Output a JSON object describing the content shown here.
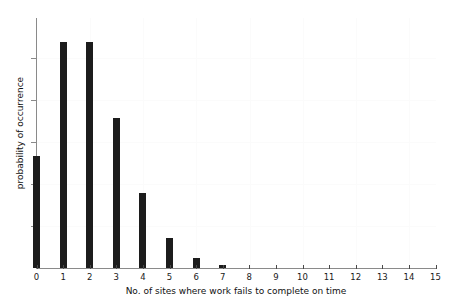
{
  "chart_data": {
    "type": "bar",
    "title": "",
    "subtitle": "",
    "xlabel": "No. of sites where work fails to complete on time",
    "ylabel": "probability of occurrence",
    "categories": [
      "0",
      "1",
      "2",
      "3",
      "4",
      "5",
      "6",
      "7",
      "8",
      "9",
      "10",
      "11",
      "12",
      "13",
      "14",
      "15"
    ],
    "values": [
      0.135,
      0.271,
      0.271,
      0.18,
      0.09,
      0.036,
      0.012,
      0.0035,
      0,
      0,
      0,
      0,
      0,
      0,
      0,
      0
    ],
    "xtick_labels": [
      "0",
      "1",
      "2",
      "3",
      "4",
      "5",
      "6",
      "7",
      "8",
      "9",
      "10",
      "11",
      "12",
      "13",
      "14",
      "15"
    ],
    "ytick_labels": [
      "",
      "",
      "",
      "",
      "",
      ""
    ],
    "xlim": [
      0,
      15
    ],
    "ylim": [
      0,
      0.3
    ],
    "grid": true,
    "legend": false,
    "legend_position": "none",
    "bar_color": "#1c1c1c",
    "axis_color": "#8a8a8a",
    "background_color": "#ffffff"
  },
  "axis": {
    "x_label_text": "No. of sites where work fails to complete on time",
    "y_label_text": "probability of occurrence"
  }
}
